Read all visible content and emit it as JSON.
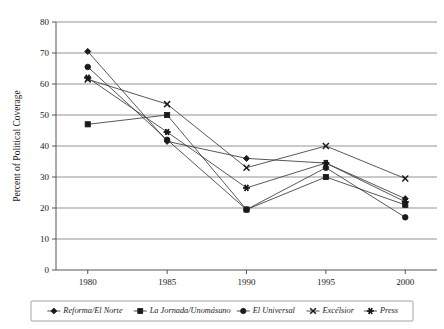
{
  "chart_data": {
    "type": "line",
    "title": "",
    "xlabel": "",
    "ylabel": "Percent of Political Coverage",
    "x": [
      1980,
      1985,
      1990,
      1995,
      2000
    ],
    "xticklabels": [
      "1980",
      "1985",
      "1990",
      "1995",
      "2000"
    ],
    "yticklabels": [
      "0",
      "10",
      "20",
      "30",
      "40",
      "50",
      "60",
      "70",
      "80"
    ],
    "yticks": [
      0,
      10,
      20,
      30,
      40,
      50,
      60,
      70,
      80
    ],
    "ylim": [
      0,
      80
    ],
    "xlim": [
      1978,
      2002
    ],
    "grid": "horizontal",
    "legend_position": "bottom",
    "series": [
      {
        "name": "Reforma/El Norte",
        "marker": "diamond",
        "values": [
          70.5,
          41.5,
          36.0,
          34.5,
          23.0
        ]
      },
      {
        "name": "La Jornada/Unomásuno",
        "marker": "square",
        "values": [
          47.0,
          50.0,
          19.5,
          30.0,
          21.0
        ]
      },
      {
        "name": "El Universal",
        "marker": "circle",
        "values": [
          65.5,
          42.0,
          19.5,
          33.0,
          17.0
        ]
      },
      {
        "name": "Excélsior",
        "marker": "x",
        "values": [
          61.5,
          53.5,
          33.0,
          40.0,
          29.5
        ]
      },
      {
        "name": "Press",
        "marker": "asterisk",
        "values": [
          62.0,
          44.5,
          26.5,
          34.5,
          22.0
        ]
      }
    ]
  },
  "axes": {
    "y_title": "Percent of Political Coverage"
  },
  "legend": {
    "entries": [
      {
        "label": "Reforma/El Norte",
        "marker": "diamond"
      },
      {
        "label": "La Jornada/Unomásuno",
        "marker": "square"
      },
      {
        "label": "El Universal",
        "marker": "circle"
      },
      {
        "label": "Excélsior",
        "marker": "x"
      },
      {
        "label": "Press",
        "marker": "asterisk"
      }
    ]
  },
  "colors": {
    "ink": "#1a1a1a",
    "grid": "#888888",
    "axis": "#555555",
    "background": "#ffffff"
  }
}
